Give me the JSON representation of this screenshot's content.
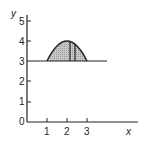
{
  "diagram": {
    "axes": {
      "x_label": "x",
      "y_label": "y",
      "x_ticks": [
        "1",
        "2",
        "3"
      ],
      "y_ticks": [
        "0",
        "1",
        "2",
        "3",
        "4",
        "5"
      ]
    },
    "region": {
      "description": "Shaded region between parabola (vertex at (2,4), crossing y=3 at x=1 and x=3) and the line y=3",
      "line_y": 3,
      "parabola_vertex": [
        2,
        4
      ],
      "parabola_roots_on_line": [
        1,
        3
      ],
      "vertical_strip_x": [
        2.15,
        2.4
      ]
    }
  }
}
